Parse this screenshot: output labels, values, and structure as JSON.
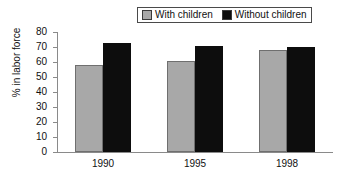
{
  "chart_data": {
    "type": "bar",
    "title": "",
    "xlabel": "",
    "ylabel": "% in labor force",
    "categories": [
      "1990",
      "1995",
      "1998"
    ],
    "series": [
      {
        "name": "With children",
        "color": "#a8a8a8",
        "values": [
          58,
          60.5,
          68
        ]
      },
      {
        "name": "Without children",
        "color": "#0d0d0d",
        "values": [
          73,
          71,
          70
        ]
      }
    ],
    "ylim": [
      0,
      80
    ],
    "ytick_step": 10,
    "yticks": [
      "80",
      "70",
      "60",
      "50",
      "40",
      "30",
      "20",
      "10",
      "0"
    ],
    "grid": false,
    "legend_position": "top-right",
    "legend_border": true
  },
  "legend": {
    "entries": [
      {
        "label": "With children",
        "swatch": "gray-swatch-icon"
      },
      {
        "label": "Without children",
        "swatch": "black-swatch-icon"
      }
    ]
  }
}
